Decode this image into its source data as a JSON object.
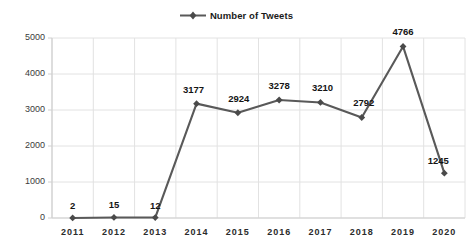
{
  "chart_data": {
    "type": "line",
    "title": "",
    "xlabel": "",
    "ylabel": "",
    "categories": [
      "2011",
      "2012",
      "2013",
      "2014",
      "2015",
      "2016",
      "2017",
      "2018",
      "2019",
      "2020"
    ],
    "values": [
      2,
      15,
      12,
      3177,
      2924,
      3278,
      3210,
      2792,
      4766,
      1245
    ],
    "point_labels": [
      "2",
      "15",
      "12",
      "3177",
      "2924",
      "3278",
      "3210",
      "2792",
      "4766",
      "1245"
    ],
    "series": [
      {
        "name": "Number of Tweets",
        "values": [
          2,
          15,
          12,
          3177,
          2924,
          3278,
          3210,
          2792,
          4766,
          1245
        ]
      }
    ],
    "ylim": [
      0,
      5000
    ],
    "yticks": [
      0,
      1000,
      2000,
      3000,
      4000,
      5000
    ],
    "ytick_labels": [
      "0",
      "1000",
      "2000",
      "3000",
      "4000",
      "5000"
    ],
    "grid": true,
    "grid_axes": "both",
    "legend_position": "top-center",
    "marker": "diamond",
    "colors": {
      "line": "#595959",
      "marker": "#4a4a4a",
      "grid": "#e2e2e2",
      "axis": "#d0d0d0",
      "text": "#262626",
      "background": "#ffffff"
    }
  },
  "legend": {
    "label": "Number of Tweets",
    "marker_icon": "diamond-marker-icon"
  },
  "plot": {
    "x0": 52,
    "x1": 465,
    "y0": 218,
    "y1": 38,
    "label_offsets": [
      {
        "dx": 0,
        "dy": -9
      },
      {
        "dx": 0,
        "dy": -9
      },
      {
        "dx": 0,
        "dy": -9
      },
      {
        "dx": -3,
        "dy": -11
      },
      {
        "dx": 1,
        "dy": -11
      },
      {
        "dx": 0,
        "dy": -11
      },
      {
        "dx": 2,
        "dy": -11
      },
      {
        "dx": 2,
        "dy": -11
      },
      {
        "dx": 0,
        "dy": -11
      },
      {
        "dx": -6,
        "dy": -9
      }
    ]
  }
}
